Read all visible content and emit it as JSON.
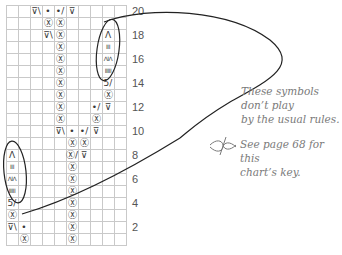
{
  "chart": {
    "columns": 10,
    "rows": 20,
    "row_numbers": [
      "20",
      "18",
      "16",
      "14",
      "12",
      "10",
      "8",
      "6",
      "4",
      "2"
    ],
    "cells": [
      {
        "row": 20,
        "col": 3,
        "sym": "⊽\\"
      },
      {
        "row": 20,
        "col": 4,
        "sym": "•"
      },
      {
        "row": 20,
        "col": 5,
        "sym": "•/"
      },
      {
        "row": 20,
        "col": 6,
        "sym": "⊽"
      },
      {
        "row": 19,
        "col": 4,
        "sym": "Ⓧ"
      },
      {
        "row": 19,
        "col": 5,
        "sym": "Ⓧ"
      },
      {
        "row": 18,
        "col": 4,
        "sym": "⊽\\"
      },
      {
        "row": 18,
        "col": 5,
        "sym": "Ⓧ"
      },
      {
        "row": 17,
        "col": 5,
        "sym": "Ⓧ"
      },
      {
        "row": 16,
        "col": 5,
        "sym": "Ⓧ"
      },
      {
        "row": 15,
        "col": 5,
        "sym": "Ⓧ"
      },
      {
        "row": 14,
        "col": 5,
        "sym": "Ⓧ"
      },
      {
        "row": 13,
        "col": 5,
        "sym": "Ⓧ"
      },
      {
        "row": 12,
        "col": 5,
        "sym": "Ⓧ"
      },
      {
        "row": 11,
        "col": 5,
        "sym": "Ⓧ"
      },
      {
        "row": 18,
        "col": 9,
        "sym": "Λ"
      },
      {
        "row": 17,
        "col": 9,
        "sym": "III"
      },
      {
        "row": 16,
        "col": 9,
        "sym": "ΛIΛ"
      },
      {
        "row": 15,
        "col": 9,
        "sym": "IIIII"
      },
      {
        "row": 14,
        "col": 9,
        "sym": "5/"
      },
      {
        "row": 13,
        "col": 9,
        "sym": "Ⓧ"
      },
      {
        "row": 12,
        "col": 8,
        "sym": "•/"
      },
      {
        "row": 12,
        "col": 9,
        "sym": "⊽"
      },
      {
        "row": 11,
        "col": 8,
        "sym": "Ⓧ"
      },
      {
        "row": 10,
        "col": 5,
        "sym": "⊽\\"
      },
      {
        "row": 10,
        "col": 6,
        "sym": "•"
      },
      {
        "row": 10,
        "col": 7,
        "sym": "•/"
      },
      {
        "row": 10,
        "col": 8,
        "sym": "⊽"
      },
      {
        "row": 9,
        "col": 6,
        "sym": "Ⓧ"
      },
      {
        "row": 9,
        "col": 7,
        "sym": "Ⓧ"
      },
      {
        "row": 8,
        "col": 6,
        "sym": "Ⓧ/"
      },
      {
        "row": 8,
        "col": 7,
        "sym": "⊽"
      },
      {
        "row": 7,
        "col": 6,
        "sym": "Ⓧ"
      },
      {
        "row": 6,
        "col": 6,
        "sym": "Ⓧ"
      },
      {
        "row": 5,
        "col": 6,
        "sym": "Ⓧ"
      },
      {
        "row": 4,
        "col": 6,
        "sym": "Ⓧ"
      },
      {
        "row": 3,
        "col": 6,
        "sym": "Ⓧ"
      },
      {
        "row": 2,
        "col": 6,
        "sym": "Ⓧ"
      },
      {
        "row": 1,
        "col": 6,
        "sym": "Ⓧ"
      },
      {
        "row": 8,
        "col": 1,
        "sym": "Λ"
      },
      {
        "row": 7,
        "col": 1,
        "sym": "III"
      },
      {
        "row": 6,
        "col": 1,
        "sym": "ΛIΛ"
      },
      {
        "row": 5,
        "col": 1,
        "sym": "IIIII"
      },
      {
        "row": 4,
        "col": 1,
        "sym": "5/"
      },
      {
        "row": 3,
        "col": 1,
        "sym": "Ⓧ"
      },
      {
        "row": 2,
        "col": 1,
        "sym": "⊽\\"
      },
      {
        "row": 2,
        "col": 2,
        "sym": "•"
      },
      {
        "row": 1,
        "col": 2,
        "sym": "Ⓧ"
      }
    ]
  },
  "notes": {
    "callout_line1": "These symbols don’t play",
    "callout_line2": "by the usual rules.",
    "key_line1": "See page 68 for this",
    "key_line2": "chart’s key.",
    "key_icon": "dragonfly-ornament-icon"
  },
  "colors": {
    "grid": "#c9c9c9",
    "symbol": "#3a3a3a",
    "note_text": "#7a7a7a",
    "ink": "#222222"
  }
}
